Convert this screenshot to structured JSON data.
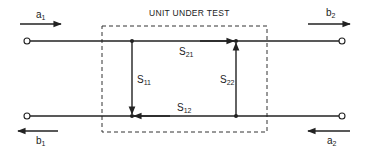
{
  "diagram": {
    "title": "UNIT UNDER TEST",
    "ports": {
      "a1": {
        "base": "a",
        "sub": "1"
      },
      "b1": {
        "base": "b",
        "sub": "1"
      },
      "a2": {
        "base": "a",
        "sub": "2"
      },
      "b2": {
        "base": "b",
        "sub": "2"
      }
    },
    "branches": {
      "S11": {
        "base": "S",
        "sub": "11"
      },
      "S21": {
        "base": "S",
        "sub": "21"
      },
      "S12": {
        "base": "S",
        "sub": "12"
      },
      "S22": {
        "base": "S",
        "sub": "22"
      }
    },
    "colors": {
      "line": "#222222",
      "background": "#ffffff"
    }
  }
}
